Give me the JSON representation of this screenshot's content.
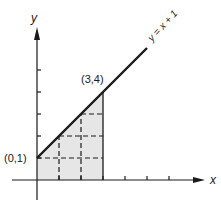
{
  "diagram": {
    "type": "function-area-diagram",
    "axes": {
      "x_label": "x",
      "y_label": "y",
      "x_ticks": [
        1,
        2,
        3,
        4,
        5,
        6
      ],
      "y_ticks": [
        1,
        2,
        3,
        4,
        5
      ]
    },
    "line": {
      "equation_label": "y = x + 1",
      "slope": 1,
      "intercept": 1,
      "x_start": 0,
      "x_end": 5
    },
    "points": [
      {
        "label": "(0,1)",
        "x": 0,
        "y": 1
      },
      {
        "label": "(3,4)",
        "x": 3,
        "y": 4
      }
    ],
    "shaded_region": {
      "x_from": 0,
      "x_to": 3,
      "under": "y = x + 1",
      "fill": "#e6e6e6"
    },
    "grid_dashed": {
      "vertical_x": [
        1,
        2
      ],
      "horizontal_y": [
        1,
        2,
        3
      ]
    },
    "colors": {
      "ink": "#1a1a1a",
      "shade": "#e6e6e6"
    }
  }
}
